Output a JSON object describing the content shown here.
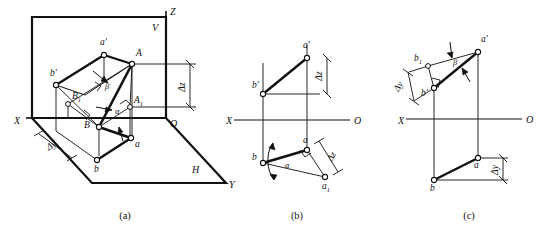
{
  "figure": {
    "stroke_color": "#111111",
    "background_color": "#ffffff",
    "accent_color": "#000000"
  },
  "captions": [
    {
      "id": "cap-a",
      "label": "(a)",
      "x": 125,
      "y": 219
    },
    {
      "id": "cap-b",
      "label": "(b)",
      "x": 297,
      "y": 219
    },
    {
      "id": "cap-c",
      "label": "(c)",
      "x": 469,
      "y": 219
    }
  ],
  "panel_a": {
    "name": "(a)",
    "kind": "axonometric-pictorial",
    "plane_labels": [
      {
        "name": "plane-label-V",
        "text": "V",
        "x": 152,
        "y": 31
      },
      {
        "name": "plane-label-H",
        "text": "H",
        "x": 192,
        "y": 173
      }
    ],
    "axis_labels": [
      {
        "name": "axis-label-Z",
        "text": "Z",
        "x": 170,
        "y": 15
      },
      {
        "name": "axis-label-X",
        "text": "X",
        "x": 14,
        "y": 124
      },
      {
        "name": "axis-label-Y",
        "text": "Y",
        "x": 229,
        "y": 188
      },
      {
        "name": "axis-label-O",
        "text": "O",
        "x": 172,
        "y": 126
      }
    ],
    "point_labels": [
      {
        "name": "point-label-a-prime",
        "text": "a′",
        "x": 100,
        "y": 45
      },
      {
        "name": "point-label-b-prime",
        "text": "b′",
        "x": 52,
        "y": 76
      },
      {
        "name": "point-label-A",
        "text": "A",
        "x": 138,
        "y": 63
      },
      {
        "name": "point-label-A1",
        "text": "A",
        "sub": "1",
        "x": 135,
        "y": 104
      },
      {
        "name": "point-label-B",
        "text": "B",
        "x": 86,
        "y": 126
      },
      {
        "name": "point-label-B1",
        "text": "B",
        "sub": "1",
        "x": 77,
        "y": 98
      },
      {
        "name": "point-label-a",
        "text": "a",
        "x": 124,
        "y": 148
      },
      {
        "name": "point-label-b",
        "text": "b",
        "x": 91,
        "y": 170
      }
    ],
    "angle_labels": [
      {
        "name": "angle-label-beta",
        "text": "β",
        "x": 105,
        "y": 89
      },
      {
        "name": "angle-label-alpha",
        "text": "α",
        "x": 116,
        "y": 113
      }
    ],
    "dimension_labels": [
      {
        "name": "dimension-delta-z",
        "text": "Δz",
        "x": 185,
        "y": 87,
        "rotation": -90
      },
      {
        "name": "dimension-delta-y",
        "text": "Δy",
        "x": 48,
        "y": 147,
        "rotation": -32
      }
    ]
  },
  "panel_b": {
    "name": "(b)",
    "kind": "orthographic-two-view",
    "axis_labels": [
      {
        "name": "axis-label-X",
        "text": "X",
        "x": 228,
        "y": 124
      },
      {
        "name": "axis-label-O",
        "text": "O",
        "x": 355,
        "y": 124
      }
    ],
    "point_labels": [
      {
        "name": "point-label-a-prime",
        "text": "a′",
        "x": 305,
        "y": 38
      },
      {
        "name": "point-label-b-prime",
        "text": "b′",
        "x": 258,
        "y": 72
      },
      {
        "name": "point-label-a",
        "text": "a",
        "x": 300,
        "y": 140
      },
      {
        "name": "point-label-b",
        "text": "b",
        "x": 253,
        "y": 167
      },
      {
        "name": "point-label-a1",
        "text": "a",
        "sub": "1",
        "x": 327,
        "y": 186
      }
    ],
    "angle_labels": [
      {
        "name": "angle-label-alpha",
        "text": "α",
        "x": 290,
        "y": 167
      }
    ],
    "dimension_labels": [
      {
        "name": "dimension-delta-z-upper",
        "text": "Δz",
        "x": 322,
        "y": 68,
        "rotation": -90
      },
      {
        "name": "dimension-delta-z-lower",
        "text": "Δz",
        "x": 338,
        "y": 161,
        "rotation": -62
      }
    ]
  },
  "panel_c": {
    "name": "(c)",
    "kind": "orthographic-two-view",
    "axis_labels": [
      {
        "name": "axis-label-X",
        "text": "X",
        "x": 399,
        "y": 124
      },
      {
        "name": "axis-label-O",
        "text": "O",
        "x": 527,
        "y": 122
      }
    ],
    "point_labels": [
      {
        "name": "point-label-a-prime",
        "text": "a′",
        "x": 483,
        "y": 36
      },
      {
        "name": "point-label-b1",
        "text": "b",
        "sub": "1",
        "x": 415,
        "y": 62
      },
      {
        "name": "point-label-b-prime",
        "text": "b′",
        "x": 424,
        "y": 95
      },
      {
        "name": "point-label-a",
        "text": "a",
        "x": 464,
        "y": 163
      },
      {
        "name": "point-label-b",
        "text": "b",
        "x": 421,
        "y": 186
      }
    ],
    "angle_labels": [
      {
        "name": "angle-label-beta",
        "text": "β",
        "x": 455,
        "y": 64
      }
    ],
    "dimension_labels": [
      {
        "name": "dimension-delta-y-upper",
        "text": "Δy",
        "x": 396,
        "y": 89,
        "rotation": -58
      },
      {
        "name": "dimension-delta-y-lower",
        "text": "Δy",
        "x": 500,
        "y": 170,
        "rotation": -90
      }
    ]
  }
}
